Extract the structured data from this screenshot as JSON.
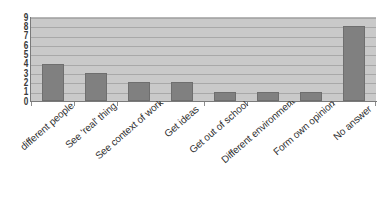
{
  "chart_data": {
    "type": "bar",
    "title": "",
    "subtitle": "",
    "xlabel": "",
    "ylabel": "",
    "ylim": [
      0,
      9
    ],
    "ytick_labels": [
      "9",
      "8",
      "7",
      "6",
      "5",
      "4",
      "3",
      "2",
      "1",
      "0"
    ],
    "grid": true,
    "legend": "none",
    "orientation": "vertical",
    "label_rotation_degrees": -41,
    "categories": [
      "different people",
      "See 'real' thing",
      "See context of work",
      "Get ideas",
      "Get out of school",
      "Different environment",
      "Form own opinion",
      "No answer"
    ],
    "values": [
      4,
      3,
      2,
      2,
      1,
      1,
      1,
      8
    ],
    "colors": {
      "bar_fill": "#808080",
      "bar_border": "#6e6e6e",
      "plot_background": "#c9c9c9",
      "gridline": "#a8a8a8",
      "axis_line": "#7a7a7a",
      "page_background": "#ffffff",
      "text": "#2f2f2f"
    }
  }
}
